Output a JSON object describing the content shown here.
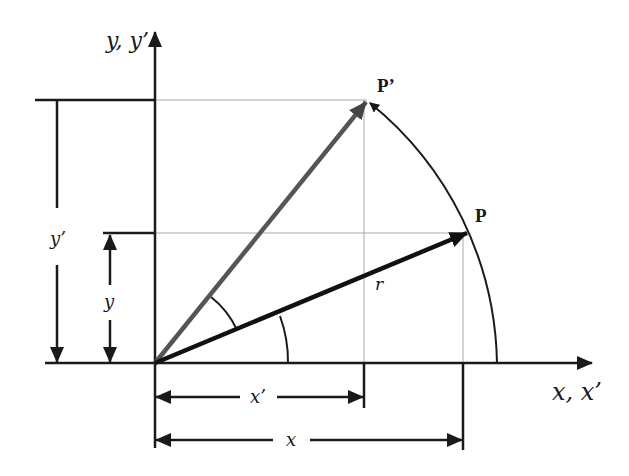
{
  "diagram": {
    "labels": {
      "y_axis": "y, y’",
      "x_axis": "x, x’",
      "point_p": "P",
      "point_p_prime": "P’",
      "radius": "r",
      "dim_y_prime": "y’",
      "dim_y": "y",
      "dim_x_prime": "x’",
      "dim_x": "x"
    },
    "colors": {
      "ink": "#1a1a1a",
      "vector_p": "#111111",
      "vector_p_prime": "#555555",
      "guide": "#aaaaaa"
    },
    "geometry": {
      "origin": [
        155,
        363
      ],
      "p": [
        467,
        233
      ],
      "p_prime": [
        367,
        100
      ],
      "radius_px": 340
    }
  }
}
